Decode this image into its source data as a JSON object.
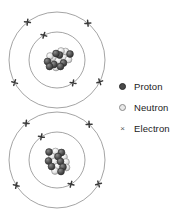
{
  "figure": {
    "background_color": "#ffffff"
  },
  "legend": {
    "items": [
      {
        "marker": "filled-circle",
        "label": "Proton",
        "color": "#4a4a4a"
      },
      {
        "marker": "open-circle",
        "label": "Neutron",
        "color": "#e8e8e8"
      },
      {
        "marker": "cross",
        "label": "Electron",
        "color": "#585858",
        "glyph": "×"
      }
    ]
  },
  "atoms": [
    {
      "name": "atom-top",
      "center": {
        "x": 57,
        "y": 60
      },
      "shells": [
        {
          "radius": 28,
          "electron_count": 2,
          "electron_angles_deg": [
            118,
            305
          ]
        },
        {
          "radius": 48,
          "electron_count": 4,
          "electron_angles_deg": [
            128,
            208,
            333,
            50
          ]
        }
      ],
      "nucleus": {
        "particle_radius": 3.4,
        "particles": [
          {
            "type": "proton",
            "x": -9.5,
            "y": 1.5
          },
          {
            "type": "neutron",
            "x": -4.0,
            "y": -2.5
          },
          {
            "type": "proton",
            "x": -3.0,
            "y": 4.5
          },
          {
            "type": "neutron",
            "x": 1.5,
            "y": 0.5
          },
          {
            "type": "proton",
            "x": 2.5,
            "y": -5.0
          },
          {
            "type": "neutron",
            "x": 7.0,
            "y": -3.0
          },
          {
            "type": "proton",
            "x": 6.5,
            "y": 3.0
          },
          {
            "type": "neutron",
            "x": 11.5,
            "y": -0.5
          },
          {
            "type": "proton",
            "x": 13.0,
            "y": -6.0
          },
          {
            "type": "neutron",
            "x": 8.5,
            "y": -8.5
          },
          {
            "type": "proton",
            "x": -7.5,
            "y": 6.5
          },
          {
            "type": "neutron",
            "x": -1.0,
            "y": 7.5
          },
          {
            "type": "proton",
            "x": 3.5,
            "y": 6.5
          },
          {
            "type": "neutron",
            "x": 4.0,
            "y": -9.0
          },
          {
            "type": "proton",
            "x": -1.0,
            "y": -6.5
          },
          {
            "type": "neutron",
            "x": -7.0,
            "y": -4.0
          }
        ]
      }
    },
    {
      "name": "atom-bottom",
      "center": {
        "x": 57,
        "y": 160
      },
      "shells": [
        {
          "radius": 28,
          "electron_count": 2,
          "electron_angles_deg": [
            124,
            300
          ]
        },
        {
          "radius": 48,
          "electron_count": 4,
          "electron_angles_deg": [
            130,
            212,
            330,
            48
          ]
        }
      ],
      "nucleus": {
        "particle_radius": 3.4,
        "particles": [
          {
            "type": "proton",
            "x": -8.0,
            "y": -8.0
          },
          {
            "type": "neutron",
            "x": -1.5,
            "y": -8.5
          },
          {
            "type": "proton",
            "x": 4.5,
            "y": -7.5
          },
          {
            "type": "neutron",
            "x": -5.0,
            "y": -3.5
          },
          {
            "type": "proton",
            "x": 1.0,
            "y": -3.5
          },
          {
            "type": "neutron",
            "x": 7.0,
            "y": -3.0
          },
          {
            "type": "proton",
            "x": -8.5,
            "y": 1.0
          },
          {
            "type": "neutron",
            "x": -2.5,
            "y": 1.5
          },
          {
            "type": "proton",
            "x": 3.5,
            "y": 1.5
          },
          {
            "type": "neutron",
            "x": 9.0,
            "y": 2.0
          },
          {
            "type": "proton",
            "x": -5.5,
            "y": 6.5
          },
          {
            "type": "neutron",
            "x": 0.5,
            "y": 6.5
          },
          {
            "type": "proton",
            "x": 6.0,
            "y": 7.0
          },
          {
            "type": "neutron",
            "x": -2.0,
            "y": 11.0
          },
          {
            "type": "proton",
            "x": 4.0,
            "y": 11.5
          },
          {
            "type": "neutron",
            "x": 9.5,
            "y": 7.5
          }
        ]
      }
    }
  ],
  "colors": {
    "proton": "#4a4a4a",
    "proton_stroke": "#2b2b2b",
    "neutron": "#ededed",
    "neutron_stroke": "#8a8a8a",
    "shell_stroke": "#7d7d7d",
    "electron": "#3a3a3a",
    "text": "#1b1b1b"
  }
}
